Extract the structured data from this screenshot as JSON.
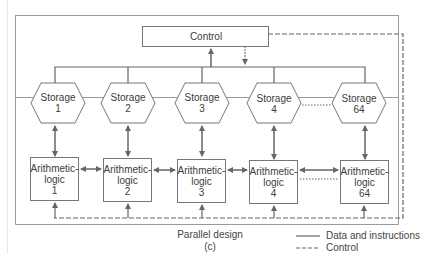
{
  "diagram": {
    "control": {
      "label": "Control"
    },
    "storage": [
      {
        "label": "Storage",
        "index": "1"
      },
      {
        "label": "Storage",
        "index": "2"
      },
      {
        "label": "Storage",
        "index": "3"
      },
      {
        "label": "Storage",
        "index": "4"
      },
      {
        "label": "Storage",
        "index": "64"
      }
    ],
    "alu": [
      {
        "label": "Arithmetic-",
        "label2": "logic",
        "index": "1"
      },
      {
        "label": "Arithmetic-",
        "label2": "logic",
        "index": "2"
      },
      {
        "label": "Arithmetic-",
        "label2": "logic",
        "index": "3"
      },
      {
        "label": "Arithmetic-",
        "label2": "logic",
        "index": "4"
      },
      {
        "label": "Arithmetic-",
        "label2": "logic",
        "index": "64"
      }
    ],
    "caption": {
      "title": "Parallel design",
      "sub": "(c)"
    },
    "legend": [
      {
        "style": "solid",
        "label": "Data and instructions"
      },
      {
        "style": "dashed",
        "label": "Control"
      }
    ],
    "colors": {
      "line": "#6a6a6a",
      "frame": "#9a9a9a"
    }
  }
}
